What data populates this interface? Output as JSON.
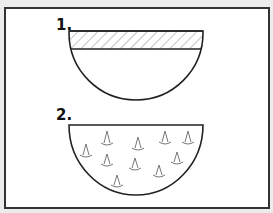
{
  "figures": [
    {
      "label": "1.",
      "description": "bowl with hatched band at top"
    },
    {
      "label": "2.",
      "description": "bowl containing small cone-shaped particles"
    }
  ],
  "colors": {
    "stroke": "#222222",
    "hatch": "#999999",
    "background": "#ffffff",
    "outer": "#ececec"
  }
}
